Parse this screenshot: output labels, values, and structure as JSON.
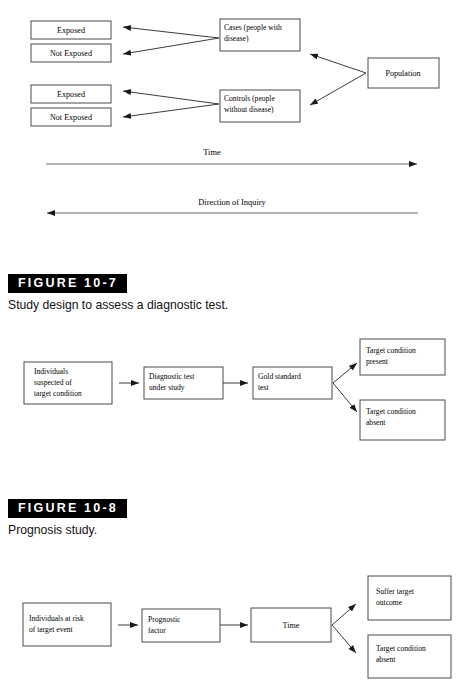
{
  "page": {
    "width": 456,
    "height": 684,
    "background": "#ffffff",
    "ink": "#000000"
  },
  "figures": [
    {
      "id": "case-control-study",
      "tag": "",
      "caption": "",
      "nodes": {
        "exposed_top": "Exposed",
        "not_exposed_top": "Not Exposed",
        "exposed_bottom": "Exposed",
        "not_exposed_bottom": "Not Exposed",
        "cases_line1": "Cases (people with",
        "cases_line2": "disease)",
        "controls_line1": "Controls (people",
        "controls_line2": "without disease)",
        "population": "Population"
      },
      "axes": {
        "time_label": "Time",
        "inquiry_label": "Direction of Inquiry"
      }
    },
    {
      "id": "diagnostic-test-study",
      "tag": "FIGURE 10-7",
      "caption": "Study design to assess a diagnostic test.",
      "nodes": {
        "individuals_l1": "Individuals",
        "individuals_l2": "suspected of",
        "individuals_l3": "target condition",
        "diagnostic_l1": "Diagnostic test",
        "diagnostic_l2": "under study",
        "gold_l1": "Gold standard",
        "gold_l2": "test",
        "present_l1": "Target condition",
        "present_l2": "present",
        "absent_l1": "Target condition",
        "absent_l2": "absent"
      }
    },
    {
      "id": "prognosis-study",
      "tag": "FIGURE 10-8",
      "caption": "Prognosis study.",
      "nodes": {
        "individuals_l1": "Individuals at risk",
        "individuals_l2": "of target event",
        "prognostic_l1": "Prognostic",
        "prognostic_l2": "factor",
        "time": "Time",
        "suffer_l1": "Suffer target",
        "suffer_l2": "outcome",
        "absent_l1": "Target condition",
        "absent_l2": "absent"
      }
    }
  ]
}
